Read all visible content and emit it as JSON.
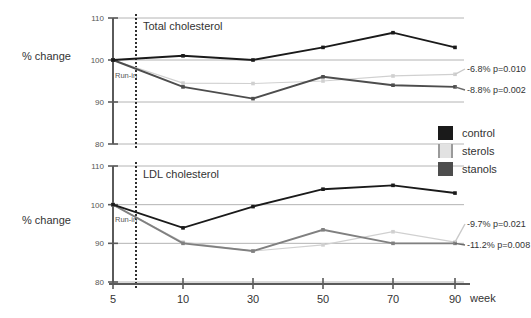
{
  "figure": {
    "axis_title": "% change",
    "x_axis_unit_label": "week"
  },
  "legend": {
    "items": [
      {
        "label": "control",
        "color": "#1a1a1a"
      },
      {
        "label": "sterols",
        "color": "#d9d9d9"
      },
      {
        "label": "stanols",
        "color": "#4d4d4d"
      }
    ]
  },
  "chart_data": [
    {
      "type": "line",
      "title": "Total cholesterol",
      "xlabel": "week",
      "ylabel": "% change",
      "x": [
        5,
        10,
        30,
        50,
        70,
        90
      ],
      "xtick_labels": [
        "5",
        "10",
        "30",
        "50",
        "70",
        "90"
      ],
      "ylim": [
        80,
        110
      ],
      "yticks": [
        80,
        90,
        100,
        110
      ],
      "ytick_labels": [
        "80",
        "90",
        "100",
        "110"
      ],
      "grid": true,
      "legend_position": "right-middle",
      "series": [
        {
          "name": "control",
          "color": "#1a1a1a",
          "values": [
            100,
            101,
            100,
            103,
            106.5,
            103
          ]
        },
        {
          "name": "sterols",
          "color": "#d0d0d0",
          "values": [
            100,
            94.5,
            94.4,
            95.0,
            96.2,
            96.6
          ]
        },
        {
          "name": "stanols",
          "color": "#4d4d4d",
          "values": [
            100,
            93.6,
            90.8,
            96.0,
            94.0,
            93.6
          ]
        }
      ],
      "annotations": [
        {
          "text": "-6.8% p=0.010",
          "series": "sterols"
        },
        {
          "text": "-8.8% p=0.002",
          "series": "stanols"
        }
      ],
      "markers": [
        {
          "text": "Run-in",
          "x": 5
        }
      ]
    },
    {
      "type": "line",
      "title": "LDL cholesterol",
      "xlabel": "week",
      "ylabel": "% change",
      "x": [
        5,
        10,
        30,
        50,
        70,
        90
      ],
      "xtick_labels": [
        "5",
        "10",
        "30",
        "50",
        "70",
        "90"
      ],
      "ylim": [
        80,
        110
      ],
      "yticks": [
        80,
        90,
        100,
        110
      ],
      "ytick_labels": [
        "80",
        "90",
        "100",
        "110"
      ],
      "grid": true,
      "legend_position": "right-middle",
      "series": [
        {
          "name": "control",
          "color": "#1a1a1a",
          "values": [
            100,
            94.0,
            99.5,
            104.0,
            105.0,
            103.0
          ]
        },
        {
          "name": "sterols",
          "color": "#d0d0d0",
          "values": [
            100,
            90.3,
            88.0,
            89.6,
            93.0,
            90.3
          ]
        },
        {
          "name": "stanols",
          "color": "#808080",
          "values": [
            100,
            90.0,
            88.0,
            93.5,
            90.0,
            90.0
          ]
        }
      ],
      "annotations": [
        {
          "text": "-9.7% p=0.021",
          "series": "sterols"
        },
        {
          "text": "-11.2% p=0.008",
          "series": "stanols"
        }
      ],
      "markers": [
        {
          "text": "Run-in",
          "x": 5
        }
      ]
    }
  ]
}
